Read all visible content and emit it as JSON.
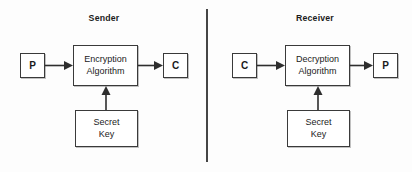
{
  "diagram": {
    "background_color": "#fdfdfd",
    "stroke_color": "#2e2e2e",
    "divider": {
      "name": "panel-divider",
      "color": "#454545"
    },
    "panels": [
      {
        "id": "sender",
        "heading": "Sender",
        "input_box": {
          "label": "P",
          "meaning": "plaintext"
        },
        "process_box": {
          "line1": "Encryption",
          "line2": "Algorithm"
        },
        "key_box": {
          "line1": "Secret",
          "line2": "Key"
        },
        "output_box": {
          "label": "C",
          "meaning": "ciphertext"
        }
      },
      {
        "id": "receiver",
        "heading": "Receiver",
        "input_box": {
          "label": "C",
          "meaning": "ciphertext"
        },
        "process_box": {
          "line1": "Decryption",
          "line2": "Algorithm"
        },
        "key_box": {
          "line1": "Secret",
          "line2": "Key"
        },
        "output_box": {
          "label": "P",
          "meaning": "plaintext"
        }
      }
    ],
    "arrows": [
      {
        "name": "arrow-plaintext-to-encryption",
        "direction": "right"
      },
      {
        "name": "arrow-encryption-to-ciphertext",
        "direction": "right"
      },
      {
        "name": "arrow-secretkey-to-encryption",
        "direction": "up"
      },
      {
        "name": "arrow-ciphertext-to-decryption",
        "direction": "right"
      },
      {
        "name": "arrow-decryption-to-plaintext",
        "direction": "right"
      },
      {
        "name": "arrow-secretkey-to-decryption",
        "direction": "up"
      }
    ]
  }
}
